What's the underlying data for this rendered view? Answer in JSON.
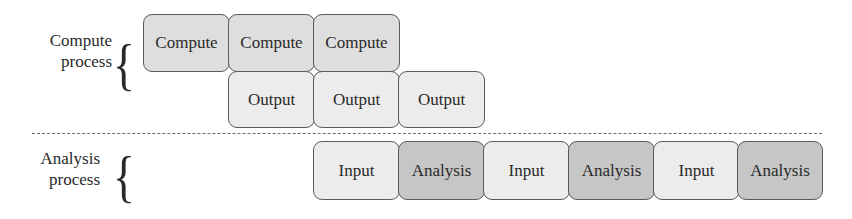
{
  "compute_process": {
    "label_line1": "Compute",
    "label_line2": "process",
    "compute_boxes": [
      "Compute",
      "Compute",
      "Compute"
    ],
    "output_boxes": [
      "Output",
      "Output",
      "Output"
    ]
  },
  "analysis_process": {
    "label_line1": "Analysis",
    "label_line2": "process",
    "boxes": [
      "Input",
      "Analysis",
      "Input",
      "Analysis",
      "Input",
      "Analysis"
    ]
  },
  "colors": {
    "compute": "#dedede",
    "light": "#ececec",
    "dark": "#c6c6c6",
    "border": "#5a5a5a"
  }
}
